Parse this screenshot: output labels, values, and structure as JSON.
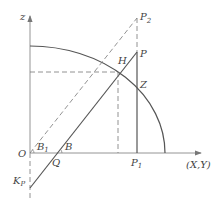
{
  "diagram": {
    "type": "geometric construction (axonometric / projection)",
    "axes": {
      "vertical_label": "z",
      "horizontal_label": "(X,Y)",
      "origin_label": "O"
    },
    "points": {
      "P2": "P",
      "P2_sub": "2",
      "P": "P",
      "H": "H",
      "Z": "Z",
      "P1": "P",
      "P1_sub": "1",
      "B1": "B",
      "B1_sub": "1",
      "B": "B",
      "Q": "Q",
      "Kp": "K",
      "Kp_sub": "P"
    },
    "elements": [
      "quarter-ellipse arc centered at O from z-axis to (X,Y) axis",
      "solid line from K_P through Q to P",
      "dashed line from O through B_1 to P_2",
      "vertical solid line from P down to P_1",
      "dashed vertical line from P_2 to P",
      "dashed horizontal line from z-axis to H",
      "dashed vertical line from H down to (X,Y) axis",
      "dashed z-axis extension below O"
    ],
    "colors": {
      "line": "#555555",
      "dash": "#777777",
      "background": "#ffffff"
    }
  }
}
